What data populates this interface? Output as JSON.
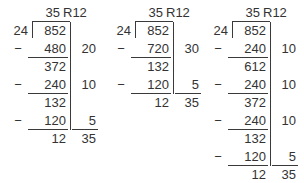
{
  "worksheet": {
    "title": "Long division partial quotients worksheet",
    "text_color": "#333333",
    "rule_color": "#3a3a3a",
    "background": "#ffffff",
    "minus_sign": "−"
  },
  "problems": [
    {
      "id": "problem-1",
      "quotient": "35",
      "remainder": "R12",
      "divisor": "24",
      "dividend": "852",
      "steps": [
        {
          "subtrahend": "480",
          "difference": "372",
          "partial": "20"
        },
        {
          "subtrahend": "240",
          "difference": "132",
          "partial": "10"
        },
        {
          "subtrahend": "120",
          "difference": "12",
          "partial": "5"
        }
      ],
      "partial_total": "35",
      "remainder_value": "12"
    },
    {
      "id": "problem-2",
      "quotient": "35",
      "remainder": "R12",
      "divisor": "24",
      "dividend": "852",
      "steps": [
        {
          "subtrahend": "720",
          "difference": "132",
          "partial": "30"
        },
        {
          "subtrahend": "120",
          "difference": "12",
          "partial": "5"
        }
      ],
      "partial_total": "35",
      "remainder_value": "12"
    },
    {
      "id": "problem-3",
      "quotient": "35",
      "remainder": "R12",
      "divisor": "24",
      "dividend": "852",
      "steps": [
        {
          "subtrahend": "240",
          "difference": "612",
          "partial": "10"
        },
        {
          "subtrahend": "240",
          "difference": "372",
          "partial": "10"
        },
        {
          "subtrahend": "240",
          "difference": "132",
          "partial": "10"
        },
        {
          "subtrahend": "120",
          "difference": "12",
          "partial": "5"
        }
      ],
      "partial_total": "35",
      "remainder_value": "12"
    }
  ]
}
